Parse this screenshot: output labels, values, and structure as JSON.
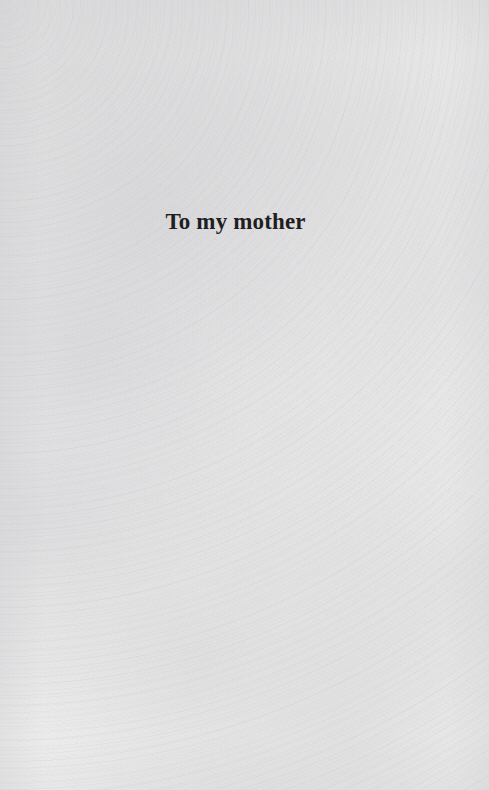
{
  "page": {
    "type": "book-dedication-page",
    "width": 489,
    "height": 790,
    "background_color": "#f5f5f5",
    "text_color": "#1f1f1f",
    "paper_texture": "mottled-scanned-paper"
  },
  "dedication": {
    "text": "To my mother"
  }
}
